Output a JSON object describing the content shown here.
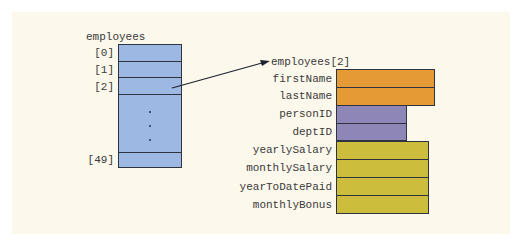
{
  "diagram": {
    "type": "array-of-structs memory layout",
    "colors": {
      "background": "#fcf8ec",
      "array_fill": "#9db8e2",
      "name_fields_fill": "#e59a36",
      "id_fields_fill": "#8d86b6",
      "pay_fields_fill": "#cdbd3c",
      "border": "#2e3340",
      "text": "#3a3a3a"
    },
    "array": {
      "name": "employees",
      "index_labels": [
        "[0]",
        "[1]",
        "[2]",
        "[49]"
      ],
      "ellipsis": "⋮"
    },
    "arrow": {
      "from": "employees[2] cell",
      "to_label": "employees[2]"
    },
    "struct": {
      "title": "employees[2]",
      "fields": [
        {
          "name": "firstName",
          "group": "name"
        },
        {
          "name": "lastName",
          "group": "name"
        },
        {
          "name": "personID",
          "group": "id"
        },
        {
          "name": "deptID",
          "group": "id"
        },
        {
          "name": "yearlySalary",
          "group": "pay"
        },
        {
          "name": "monthlySalary",
          "group": "pay"
        },
        {
          "name": "yearToDatePaid",
          "group": "pay"
        },
        {
          "name": "monthlyBonus",
          "group": "pay"
        }
      ]
    }
  }
}
